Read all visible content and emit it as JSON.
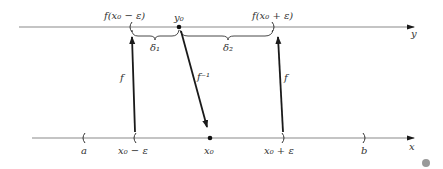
{
  "diagram": {
    "colors": {
      "axis": "#8a8a8a",
      "arrow": "#1a1a1a",
      "text": "#333333",
      "dot": "#999999"
    },
    "y_axis": {
      "label": "y",
      "labels": {
        "left_endpoint": "f(x₀ − ε)",
        "point": "y₀",
        "right_endpoint": "f(x₀ + ε)",
        "delta1": "δ₁",
        "delta2": "δ₂"
      }
    },
    "x_axis": {
      "label": "x",
      "labels": {
        "a": "a",
        "left": "x₀ − ε",
        "point": "x₀",
        "right": "x₀ + ε",
        "b": "b"
      }
    },
    "arrows": {
      "f_left": "f",
      "f_inverse": "f⁻¹",
      "f_right": "f"
    }
  }
}
